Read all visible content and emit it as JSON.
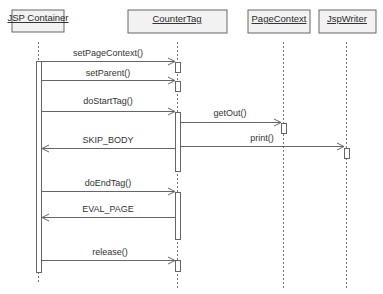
{
  "diagram": {
    "type": "UML sequence diagram",
    "colors": {
      "box_fill": "#f2f2f2",
      "box_stroke": "#555555",
      "line": "#666666",
      "text": "#2a2a2a"
    },
    "participants": [
      {
        "id": "jsp",
        "label": "JSP Container",
        "x": 38
      },
      {
        "id": "tag",
        "label": "CounterTag",
        "x": 177
      },
      {
        "id": "ctx",
        "label": "PageContext",
        "x": 283
      },
      {
        "id": "out",
        "label": "JspWriter",
        "x": 346
      }
    ],
    "messages": [
      {
        "label": "setPageContext()",
        "from": "jsp",
        "to": "tag",
        "kind": "call"
      },
      {
        "label": "setParent()",
        "from": "jsp",
        "to": "tag",
        "kind": "call"
      },
      {
        "label": "doStartTag()",
        "from": "jsp",
        "to": "tag",
        "kind": "call"
      },
      {
        "label": "getOut()",
        "from": "tag",
        "to": "ctx",
        "kind": "call"
      },
      {
        "label": "SKIP_BODY",
        "from": "tag",
        "to": "jsp",
        "kind": "return"
      },
      {
        "label": "print()",
        "from": "tag",
        "to": "out",
        "kind": "call"
      },
      {
        "label": "doEndTag()",
        "from": "jsp",
        "to": "tag",
        "kind": "call"
      },
      {
        "label": "EVAL_PAGE",
        "from": "tag",
        "to": "jsp",
        "kind": "return"
      },
      {
        "label": "release()",
        "from": "jsp",
        "to": "tag",
        "kind": "call"
      }
    ]
  }
}
